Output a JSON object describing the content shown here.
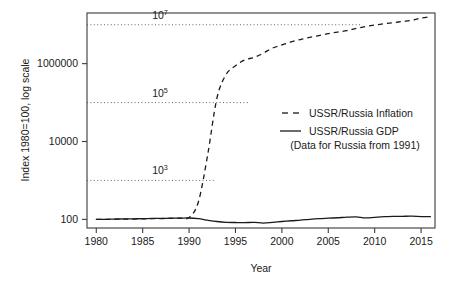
{
  "chart_data": {
    "type": "line",
    "title": "",
    "xlabel": "Year",
    "ylabel": "Index 1980=100, log scale",
    "log_y": true,
    "grid": true,
    "grid_style": "dotted horizontal reference lines at 10^3, 10^5, 10^7",
    "legend_position": "center-right inside plot",
    "xlim": [
      1979,
      2016.5
    ],
    "ylim": [
      60,
      20000000
    ],
    "x_ticks": [
      1980,
      1985,
      1990,
      1995,
      2000,
      2005,
      2010,
      2015
    ],
    "x_tick_labels": [
      "1980",
      "1985",
      "1990",
      "1995",
      "2000",
      "2005",
      "2010",
      "2015"
    ],
    "y_ticks": [
      100,
      10000,
      1000000
    ],
    "y_tick_labels": [
      "100",
      "10000",
      "1000000"
    ],
    "reference_lines": [
      {
        "label_base": "10",
        "label_exponent": "7",
        "value": 10000000,
        "x_start": 1979,
        "x_end": 2008.5
      },
      {
        "label_base": "10",
        "label_exponent": "5",
        "value": 100000,
        "x_start": 1979,
        "x_end": 1996.5
      },
      {
        "label_base": "10",
        "label_exponent": "3",
        "value": 1000,
        "x_start": 1979,
        "x_end": 1992.8
      }
    ],
    "series": [
      {
        "name": "USSR/Russia Inflation",
        "style": "dashed",
        "x": [
          1980,
          1981,
          1982,
          1983,
          1984,
          1985,
          1986,
          1987,
          1988,
          1989,
          1990,
          1991,
          1992,
          1993,
          1994,
          1995,
          1996,
          1997,
          1998,
          1999,
          2000,
          2001,
          2002,
          2003,
          2004,
          2005,
          2006,
          2007,
          2008,
          2009,
          2010,
          2011,
          2012,
          2013,
          2014,
          2015,
          2016
        ],
        "values": [
          100,
          100,
          101,
          101,
          102,
          103,
          104,
          105,
          106,
          108,
          112,
          280,
          4500,
          130000,
          530000,
          880000,
          1250000,
          1440000,
          1860000,
          2520000,
          3030000,
          3610000,
          4170000,
          4740000,
          5250000,
          5900000,
          6460000,
          7040000,
          8030000,
          8980000,
          9780000,
          10600000,
          11300000,
          12100000,
          13000000,
          14800000,
          16000000
        ]
      },
      {
        "name": "USSR/Russia GDP",
        "style": "solid",
        "note": "(Data for Russia from 1991)",
        "x": [
          1980,
          1981,
          1982,
          1983,
          1984,
          1985,
          1986,
          1987,
          1988,
          1989,
          1990,
          1991,
          1992,
          1993,
          1994,
          1995,
          1996,
          1997,
          1998,
          1999,
          2000,
          2001,
          2002,
          2003,
          2004,
          2005,
          2006,
          2007,
          2008,
          2009,
          2010,
          2011,
          2012,
          2013,
          2014,
          2015,
          2016
        ],
        "values": [
          100,
          100.5,
          101.5,
          103,
          103.5,
          104,
          105.5,
          106,
          107,
          107.5,
          108.5,
          104,
          95,
          88,
          84,
          83,
          82.5,
          83.5,
          80.5,
          84,
          88,
          92,
          95.5,
          100,
          104,
          107,
          110,
          114,
          116,
          109,
          113,
          117,
          119,
          120,
          120.5,
          118,
          117
        ]
      }
    ]
  },
  "legend": {
    "entries": [
      {
        "label": "USSR/Russia Inflation",
        "key": "dashed"
      },
      {
        "label": "USSR/Russia GDP",
        "key": "solid"
      }
    ],
    "note": "(Data for Russia from 1991)"
  },
  "axes": {
    "x_title": "Year",
    "y_title": "Index 1980=100, log scale"
  },
  "ticks": {
    "y": [
      "1000000",
      "10000",
      "100"
    ],
    "x": [
      "1980",
      "1985",
      "1990",
      "1995",
      "2000",
      "2005",
      "2010",
      "2015"
    ]
  },
  "reference_labels": [
    {
      "base": "10",
      "exp": "7"
    },
    {
      "base": "10",
      "exp": "5"
    },
    {
      "base": "10",
      "exp": "3"
    }
  ]
}
